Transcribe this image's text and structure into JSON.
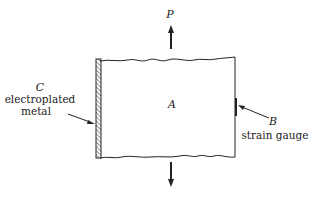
{
  "diagram": {
    "labels": {
      "load": "P",
      "plate": "A",
      "gauge_letter": "B",
      "gauge_text": "strain gauge",
      "coating_letter": "C",
      "coating_text_1": "electroplated",
      "coating_text_2": "metal"
    },
    "colors": {
      "stroke": "#222222",
      "background": "#ffffff"
    }
  }
}
